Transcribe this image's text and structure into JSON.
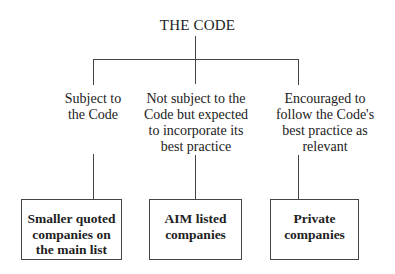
{
  "diagram": {
    "title": "THE CODE",
    "branches": [
      {
        "condition_lines": [
          "Subject to",
          "the Code"
        ],
        "box_lines": [
          "Smaller quoted",
          "companies on",
          "the main list"
        ]
      },
      {
        "condition_lines": [
          "Not subject to the",
          "Code but expected",
          "to incorporate its",
          "best practice"
        ],
        "box_lines": [
          "AIM listed",
          "companies"
        ]
      },
      {
        "condition_lines": [
          "Encouraged to",
          "follow the Code's",
          "best practice as",
          "relevant"
        ],
        "box_lines": [
          "Private",
          "companies"
        ]
      }
    ],
    "colors": {
      "line": "#444444",
      "text": "#222222",
      "background": "#ffffff"
    }
  }
}
